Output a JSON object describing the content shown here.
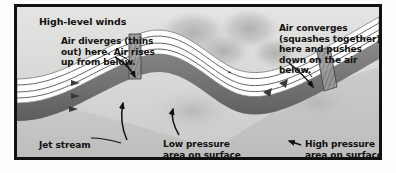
{
  "figure": {
    "kind": "jet-stream-wave-diagram",
    "frame_border_color": "#111111",
    "background_color": "#d8d8d6",
    "surface_color": "#cfcfcd",
    "ribbon_top_color": "#ffffff",
    "ribbon_underside_color": "#6e6e6e",
    "cloud_blob_color": "#b4b4b2",
    "ink_color": "#111111"
  },
  "labels": {
    "title": "High-level winds",
    "diverges": "Air diverges (thins\nout) here. Air rises\nup from below.",
    "converges": "Air converges\n(squashes together)\nhere and pushes\ndown on the air\nbelow.",
    "jet_stream": "Jet stream",
    "low_pressure": "Low pressure\narea on surface",
    "high_pressure": "High pressure\narea on surface"
  },
  "annotations": {
    "diverge_arrow": "arrow pointing down-right to the wave trough",
    "converge_arrow": "arrow pointing down-left to the wave crest",
    "jet_stream_leader": "curved leader line to arrowhead on the ribbon",
    "low_pressure_arrow": "curved arrow pointing up to the surface low",
    "high_pressure_arrow": "short arrow pointing left to the surface high",
    "flow_arrows": "small arrowheads along the wind streamlines"
  }
}
